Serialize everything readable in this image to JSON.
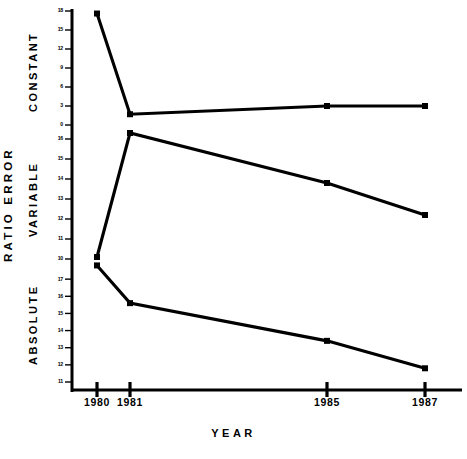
{
  "chart_data": {
    "type": "line",
    "title": "",
    "xlabel": "YEAR",
    "ylabel": "RATIO ERROR",
    "x": [
      1980,
      1981,
      1985,
      1987
    ],
    "categories": [
      "1980",
      "1981",
      "1985",
      "1987"
    ],
    "grid": false,
    "legend_position": "none",
    "panels": [
      {
        "name": "CONSTANT",
        "label": "CONSTANT",
        "ylim": [
          0,
          18
        ],
        "yticks": [
          0,
          3,
          6,
          9,
          12,
          15,
          18
        ],
        "ytick_labels": [
          "0",
          "3",
          "6",
          "9",
          "12",
          "15",
          "18"
        ],
        "series": [
          {
            "name": "CONSTANT",
            "values": [
              17.6,
              1.7,
              3.0,
              3.0
            ]
          }
        ]
      },
      {
        "name": "VARIABLE",
        "label": "VARIABLE",
        "ylim": [
          10,
          16
        ],
        "yticks": [
          10,
          11,
          12,
          13,
          14,
          15,
          16
        ],
        "ytick_labels": [
          "10",
          "11",
          "12",
          "13",
          "14",
          "15",
          "16"
        ],
        "series": [
          {
            "name": "VARIABLE",
            "values": [
              10.1,
              16.3,
              13.8,
              12.2
            ]
          }
        ]
      },
      {
        "name": "ABSOLUTE",
        "label": "ABSOLUTE",
        "ylim": [
          11,
          18
        ],
        "yticks": [
          11,
          12,
          13,
          14,
          15,
          16,
          17
        ],
        "ytick_labels": [
          "11",
          "12",
          "13",
          "14",
          "15",
          "16",
          "17"
        ],
        "series": [
          {
            "name": "ABSOLUTE",
            "values": [
              17.8,
              15.6,
              13.4,
              11.8
            ]
          }
        ]
      }
    ],
    "line_color": "#000000",
    "marker": "square",
    "background": "#ffffff"
  },
  "axes": {
    "outer_y_title": "RATIO ERROR",
    "x_title": "YEAR"
  }
}
